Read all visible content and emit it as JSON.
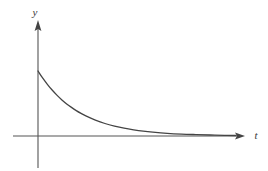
{
  "figure": {
    "background_color": "#ffffff",
    "axis_color": "#555555",
    "curve_color": "#444444",
    "label_color": "#3a3a3a",
    "axis_line_width": 1.1,
    "curve_line_width": 1.3,
    "width": 268,
    "height": 171
  },
  "axes": {
    "origin": {
      "x": 38,
      "y": 136
    },
    "horizontal": {
      "name": "t-axis",
      "label": "t",
      "label_x": 256,
      "label_y": 139,
      "x_start": 13,
      "x_end": 245,
      "y": 136,
      "arrow": "right"
    },
    "vertical": {
      "name": "y-axis",
      "label": "y",
      "label_x": 38,
      "label_y": 16,
      "y_top": 20,
      "y_bottom": 168,
      "x": 38,
      "arrow": "up"
    }
  },
  "chart_data": {
    "type": "line",
    "title": "",
    "subtitle": "",
    "xlabel": "t",
    "ylabel": "y",
    "grid": false,
    "legend": null,
    "annotations": [],
    "xlim": [
      0,
      207
    ],
    "ylim": [
      0,
      65
    ],
    "curve_equation": "y = A * exp(-k * t)",
    "amplitude": 65,
    "decay_constant": 0.0235,
    "x_tick_labels": [],
    "y_tick_labels": [],
    "series": [
      {
        "name": "exponential-decay",
        "x": [
          0,
          5,
          10,
          15,
          20,
          25,
          30,
          35,
          40,
          45,
          50,
          60,
          70,
          80,
          90,
          100,
          110,
          120,
          135,
          150,
          165,
          180,
          195,
          207
        ],
        "y": [
          65,
          57.8,
          51.4,
          45.7,
          40.6,
          36.1,
          32.1,
          28.6,
          25.4,
          22.6,
          20.1,
          15.9,
          12.5,
          9.9,
          7.8,
          6.2,
          4.9,
          3.9,
          2.7,
          1.9,
          1.4,
          1.0,
          0.7,
          0.5
        ]
      }
    ]
  }
}
